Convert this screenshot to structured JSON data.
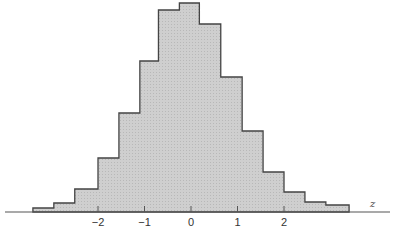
{
  "chart_data": {
    "type": "bar",
    "subtype": "histogram",
    "title": "",
    "xlabel": "z",
    "ylabel": "",
    "bin_width": 0.5,
    "bin_edges": [
      -3.25,
      -2.75,
      -2.25,
      -1.75,
      -1.25,
      -0.75,
      -0.25,
      0.25,
      0.75,
      1.25,
      1.75,
      2.25,
      2.75,
      3.25
    ],
    "bins": [
      {
        "x0": -3.4,
        "x1": -2.95,
        "height": 4
      },
      {
        "x0": -2.95,
        "x1": -2.5,
        "height": 9
      },
      {
        "x0": -2.5,
        "x1": -2.0,
        "height": 23
      },
      {
        "x0": -2.0,
        "x1": -1.55,
        "height": 54
      },
      {
        "x0": -1.55,
        "x1": -1.1,
        "height": 99
      },
      {
        "x0": -1.1,
        "x1": -0.7,
        "height": 151
      },
      {
        "x0": -0.7,
        "x1": -0.25,
        "height": 202
      },
      {
        "x0": -0.25,
        "x1": 0.18,
        "height": 209
      },
      {
        "x0": 0.18,
        "x1": 0.64,
        "height": 188
      },
      {
        "x0": 0.64,
        "x1": 1.1,
        "height": 135
      },
      {
        "x0": 1.1,
        "x1": 1.55,
        "height": 81
      },
      {
        "x0": 1.55,
        "x1": 2.0,
        "height": 40
      },
      {
        "x0": 2.0,
        "x1": 2.45,
        "height": 20
      },
      {
        "x0": 2.45,
        "x1": 2.9,
        "height": 10
      },
      {
        "x0": 2.9,
        "x1": 3.4,
        "height": 7
      }
    ],
    "x_ticks": [
      -2,
      -1,
      0,
      1,
      2
    ],
    "x_tick_labels": [
      "−2",
      "−1",
      "0",
      "1",
      "2"
    ],
    "y_axis_shown": false,
    "grid": false,
    "fill_color": "#c8c8c8",
    "stroke_color": "#444444"
  },
  "axis": {
    "variable_label": "z",
    "tick_labels": [
      "−2",
      "−1",
      "0",
      "1",
      "2"
    ]
  }
}
